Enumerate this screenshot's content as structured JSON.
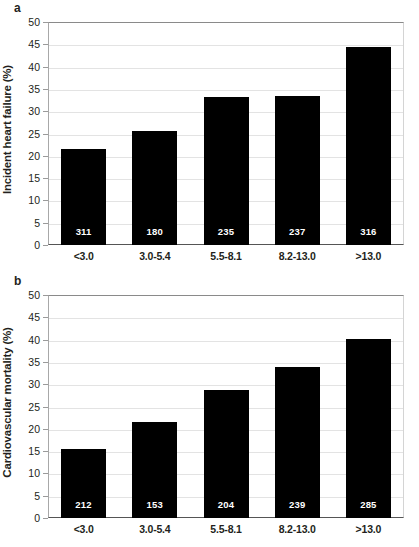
{
  "figure": {
    "panels": [
      {
        "letter": "a",
        "ylabel": "Incident heart failure (%)",
        "name": "incident-heart-failure"
      },
      {
        "letter": "b",
        "ylabel": "Cardiovascular mortality (%)",
        "name": "cardiovascular-mortality"
      }
    ]
  },
  "chart_data": [
    {
      "type": "bar",
      "title": "",
      "panel_label": "a",
      "xlabel": "",
      "ylabel": "Incident heart failure (%)",
      "categories": [
        "<3.0",
        "3.0-5.4",
        "5.5-8.1",
        "8.2-13.0",
        ">13.0"
      ],
      "values": [
        21.5,
        25.5,
        33.2,
        33.4,
        44.5
      ],
      "bar_labels": [
        "311",
        "180",
        "235",
        "237",
        "316"
      ],
      "ylim": [
        0,
        50
      ],
      "yticks": [
        0,
        5,
        10,
        15,
        20,
        25,
        30,
        35,
        40,
        45,
        50
      ],
      "ytick_labels": [
        "0",
        "5",
        "10",
        "15",
        "20",
        "25",
        "30",
        "35",
        "40",
        "45",
        "50"
      ],
      "grid": true,
      "legend": false,
      "bar_color": "#000000",
      "bar_label_color": "#ffffff"
    },
    {
      "type": "bar",
      "title": "",
      "panel_label": "b",
      "xlabel": "",
      "ylabel": "Cardiovascular mortality (%)",
      "categories": [
        "<3.0",
        "3.0-5.4",
        "5.5-8.1",
        "8.2-13.0",
        ">13.0"
      ],
      "values": [
        15.4,
        21.6,
        28.7,
        33.8,
        40.1
      ],
      "bar_labels": [
        "212",
        "153",
        "204",
        "239",
        "285"
      ],
      "ylim": [
        0,
        50
      ],
      "yticks": [
        0,
        5,
        10,
        15,
        20,
        25,
        30,
        35,
        40,
        45,
        50
      ],
      "ytick_labels": [
        "0",
        "5",
        "10",
        "15",
        "20",
        "25",
        "30",
        "35",
        "40",
        "45",
        "50"
      ],
      "grid": true,
      "legend": false,
      "bar_color": "#000000",
      "bar_label_color": "#ffffff"
    }
  ]
}
